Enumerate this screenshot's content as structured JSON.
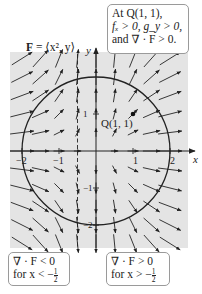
{
  "figure": {
    "field_label": {
      "prefix": "F",
      "eq": " = ⟨x², y⟩"
    },
    "axes": {
      "x_label": "x",
      "y_label": "y",
      "x_ticks": [
        {
          "v": -2,
          "label": "−2"
        },
        {
          "v": -1,
          "label": "−1"
        },
        {
          "v": 1,
          "label": "1"
        },
        {
          "v": 2,
          "label": "2"
        }
      ],
      "y_ticks": [
        {
          "v": 1,
          "label": "1"
        },
        {
          "v": -1,
          "label": "−1"
        },
        {
          "v": -2,
          "label": "−2"
        }
      ]
    },
    "circle_radius": 2,
    "dashed_line_x": -0.5,
    "point": {
      "label": "Q(1, 1)",
      "x": 1,
      "y": 1
    },
    "callouts": {
      "top": {
        "line1": "At Q(1, 1),",
        "line2": "fₓ > 0, g_y > 0,",
        "line3": "and ∇ · F > 0."
      },
      "left": {
        "line1": "∇ · F < 0",
        "line2_prefix": "for x < −",
        "frac_num": "1",
        "frac_den": "2"
      },
      "right": {
        "line1": "∇ · F > 0",
        "line2_prefix": "for x > −",
        "frac_num": "1",
        "frac_den": "2"
      }
    },
    "colors": {
      "background": "#e4e4e4",
      "stroke": "#222222",
      "callout_border": "#9a9a9a"
    }
  }
}
